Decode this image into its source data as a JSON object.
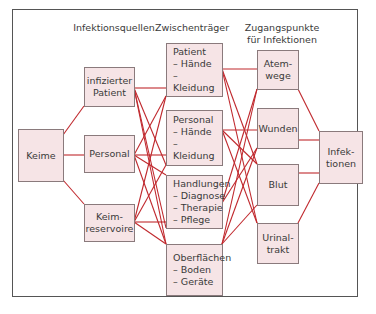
{
  "headers": {
    "sources": "Infektionsquellen",
    "carriers": "Zwischenträger",
    "entry": "Zugangspunkte\nfür Infektionen"
  },
  "nodes": {
    "keime": "Keime",
    "infizierter_patient": "infizierter\nPatient",
    "personal_src": "Personal",
    "keimreservoire": "Keim-\nreservoire",
    "patient": "Patient\n– Hände\n– Kleidung",
    "personal": "Personal\n– Hände\n– Kleidung",
    "handlungen": "Handlungen\n– Diagnose\n– Therapie\n– Pflege",
    "oberflaechen": "Oberflächen\n– Boden\n– Geräte",
    "atemwege": "Atem-\nwege",
    "wunden": "Wunden",
    "blut": "Blut",
    "urinaltrakt": "Urinal-\ntrakt",
    "infektionen": "Infek-\ntionen"
  },
  "colors": {
    "box_fill": "#f6e4e6",
    "line": "#c0282d",
    "frame": "#555555"
  }
}
